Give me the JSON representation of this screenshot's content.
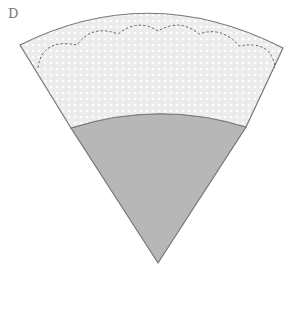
{
  "figure": {
    "label": "D",
    "colors": {
      "band_fill": "#ececec",
      "band_dots": "#ffffff",
      "cone_fill": "#b7b7b7",
      "outline": "#777777",
      "dashed_line": "#666666"
    },
    "parts": [
      {
        "name": "band",
        "pattern": "dotted",
        "edge": "scalloped dashed line"
      },
      {
        "name": "cone",
        "pattern": "solid gray"
      }
    ],
    "scallop_count": 6
  }
}
